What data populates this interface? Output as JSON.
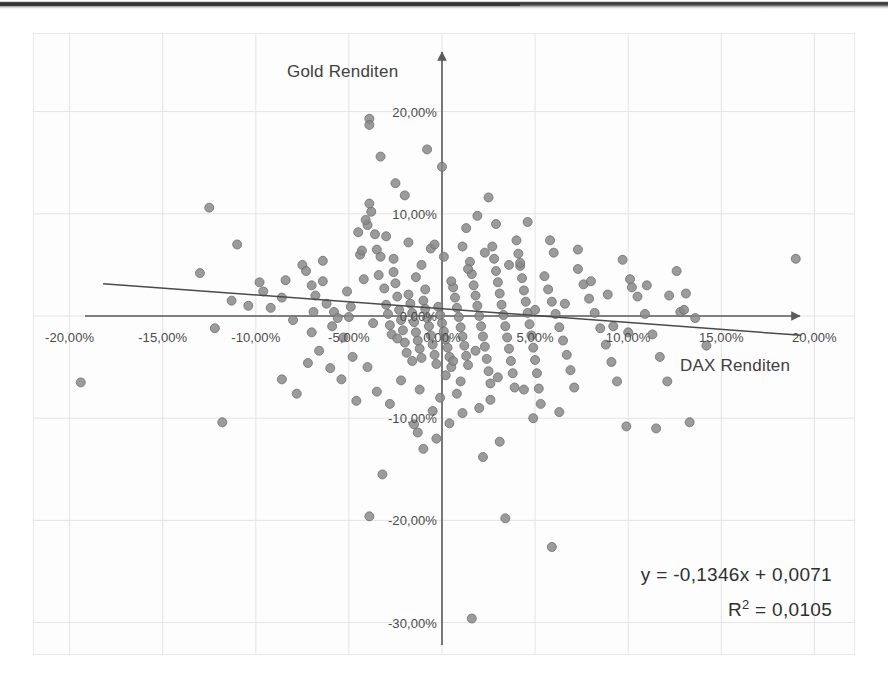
{
  "chart_data": {
    "type": "scatter",
    "title": "",
    "xlabel": "DAX Renditen",
    "ylabel": "Gold Renditen",
    "xlim": [
      -22.0,
      22.0
    ],
    "ylim": [
      -32.0,
      24.0
    ],
    "grid": true,
    "legend": "none",
    "x_ticks": [
      "-20,00%",
      "-15,00%",
      "-10,00%",
      "-5,00%",
      "0,00%",
      "5,00%",
      "10,00%",
      "15,00%",
      "20,00%"
    ],
    "x_tick_values": [
      -20,
      -15,
      -10,
      -5,
      0,
      5,
      10,
      15,
      20
    ],
    "y_ticks": [
      "20,00%",
      "10,00%",
      "0,00%",
      "-10,00%",
      "-20,00%",
      "-30,00%"
    ],
    "y_tick_values": [
      20,
      10,
      0,
      -10,
      -20,
      -30
    ],
    "annotations": {
      "equation": "y = -0,1346x + 0,0071",
      "r_squared_prefix": "R",
      "r_squared_sup": "2",
      "r_squared_value": " = 0,0105"
    },
    "trendline": {
      "slope": -0.1346,
      "intercept": 0.71,
      "x_start": -18.2,
      "x_end": 19.3,
      "color": "#4a4a4a"
    },
    "marker": {
      "color": "#8a8a8a",
      "edge_color": "#6f6f6f",
      "size": 9,
      "shape": "circle"
    },
    "axis_color": "#5a5a5a",
    "grid_color": "#e4e4e4",
    "points": [
      [
        -11.8,
        -10.4
      ],
      [
        -19.4,
        -6.5
      ],
      [
        -12.5,
        10.6
      ],
      [
        -11.0,
        7.0
      ],
      [
        -12.2,
        -1.2
      ],
      [
        -13.0,
        4.2
      ],
      [
        -11.3,
        1.5
      ],
      [
        -9.6,
        2.4
      ],
      [
        -8.6,
        1.8
      ],
      [
        -7.5,
        5.0
      ],
      [
        -7.0,
        3.0
      ],
      [
        -6.4,
        3.4
      ],
      [
        -6.2,
        1.2
      ],
      [
        -5.8,
        0.4
      ],
      [
        -5.6,
        -0.2
      ],
      [
        -5.3,
        -2.1
      ],
      [
        -5.0,
        -0.1
      ],
      [
        -6.0,
        -5.1
      ],
      [
        -5.4,
        -6.2
      ],
      [
        -4.6,
        -8.3
      ],
      [
        -4.4,
        6.0
      ],
      [
        -4.2,
        3.6
      ],
      [
        -4.0,
        8.9
      ],
      [
        -3.8,
        10.2
      ],
      [
        -3.6,
        8.0
      ],
      [
        -3.5,
        6.5
      ],
      [
        -3.3,
        5.8
      ],
      [
        -3.1,
        2.7
      ],
      [
        -3.0,
        1.1
      ],
      [
        -2.9,
        0.2
      ],
      [
        -2.8,
        -0.9
      ],
      [
        -2.7,
        -1.8
      ],
      [
        -2.6,
        4.3
      ],
      [
        -2.5,
        3.2
      ],
      [
        -2.4,
        1.9
      ],
      [
        -2.3,
        0.6
      ],
      [
        -2.2,
        -0.4
      ],
      [
        -2.1,
        -1.4
      ],
      [
        -2.0,
        -2.6
      ],
      [
        -1.9,
        -3.6
      ],
      [
        -1.8,
        2.1
      ],
      [
        -1.7,
        1.2
      ],
      [
        -1.6,
        0.3
      ],
      [
        -1.5,
        -0.6
      ],
      [
        -1.4,
        -1.6
      ],
      [
        -1.3,
        -2.4
      ],
      [
        -1.2,
        -3.2
      ],
      [
        -1.1,
        -4.1
      ],
      [
        -1.0,
        1.5
      ],
      [
        -0.9,
        0.7
      ],
      [
        -0.8,
        -0.2
      ],
      [
        -0.7,
        -1.0
      ],
      [
        -0.6,
        -1.9
      ],
      [
        -0.5,
        -2.8
      ],
      [
        -0.4,
        -3.8
      ],
      [
        -0.3,
        -4.7
      ],
      [
        -0.2,
        0.9
      ],
      [
        -0.1,
        0.1
      ],
      [
        0.0,
        -0.7
      ],
      [
        0.1,
        -1.5
      ],
      [
        0.2,
        -2.3
      ],
      [
        0.3,
        -3.1
      ],
      [
        0.4,
        -4.0
      ],
      [
        0.5,
        -5.0
      ],
      [
        0.6,
        2.8
      ],
      [
        0.7,
        1.8
      ],
      [
        0.8,
        0.8
      ],
      [
        0.9,
        -0.1
      ],
      [
        1.0,
        -1.1
      ],
      [
        1.1,
        -2.0
      ],
      [
        1.2,
        -2.9
      ],
      [
        1.3,
        -3.9
      ],
      [
        1.4,
        -4.8
      ],
      [
        1.5,
        5.3
      ],
      [
        1.6,
        4.1
      ],
      [
        1.7,
        3.0
      ],
      [
        1.8,
        2.0
      ],
      [
        1.9,
        1.0
      ],
      [
        2.0,
        0.0
      ],
      [
        2.1,
        -1.0
      ],
      [
        2.2,
        -2.0
      ],
      [
        2.3,
        -3.0
      ],
      [
        2.4,
        -4.2
      ],
      [
        2.5,
        -5.4
      ],
      [
        2.6,
        -6.6
      ],
      [
        2.7,
        6.8
      ],
      [
        2.8,
        5.6
      ],
      [
        2.9,
        4.4
      ],
      [
        3.0,
        3.3
      ],
      [
        3.1,
        2.2
      ],
      [
        3.2,
        1.1
      ],
      [
        3.3,
        0.1
      ],
      [
        3.4,
        -1.0
      ],
      [
        3.5,
        -2.1
      ],
      [
        3.6,
        -3.2
      ],
      [
        3.7,
        -4.4
      ],
      [
        3.8,
        -5.6
      ],
      [
        3.9,
        -7.0
      ],
      [
        4.0,
        7.4
      ],
      [
        4.1,
        6.1
      ],
      [
        4.2,
        4.9
      ],
      [
        4.3,
        3.7
      ],
      [
        4.4,
        2.5
      ],
      [
        4.5,
        1.4
      ],
      [
        4.6,
        0.3
      ],
      [
        4.7,
        -0.8
      ],
      [
        4.8,
        -1.9
      ],
      [
        4.9,
        -3.1
      ],
      [
        5.0,
        -4.3
      ],
      [
        5.1,
        -5.6
      ],
      [
        5.2,
        -7.1
      ],
      [
        5.3,
        -8.6
      ],
      [
        5.5,
        3.9
      ],
      [
        5.7,
        2.6
      ],
      [
        5.9,
        1.4
      ],
      [
        6.1,
        0.2
      ],
      [
        6.3,
        -1.1
      ],
      [
        6.5,
        -2.4
      ],
      [
        6.7,
        -3.8
      ],
      [
        6.9,
        -5.3
      ],
      [
        7.1,
        -7.0
      ],
      [
        7.3,
        4.6
      ],
      [
        7.6,
        3.1
      ],
      [
        7.9,
        1.7
      ],
      [
        8.2,
        0.3
      ],
      [
        8.5,
        -1.2
      ],
      [
        8.8,
        -2.8
      ],
      [
        9.1,
        -4.5
      ],
      [
        9.4,
        -6.4
      ],
      [
        9.7,
        5.5
      ],
      [
        10.1,
        3.6
      ],
      [
        10.5,
        1.9
      ],
      [
        10.9,
        0.2
      ],
      [
        11.3,
        -1.8
      ],
      [
        11.7,
        -4.0
      ],
      [
        12.1,
        -6.4
      ],
      [
        12.6,
        4.4
      ],
      [
        13.1,
        2.2
      ],
      [
        13.6,
        -0.2
      ],
      [
        14.2,
        -2.9
      ],
      [
        19.0,
        5.6
      ],
      [
        -3.9,
        19.3
      ],
      [
        -3.9,
        18.7
      ],
      [
        -3.3,
        15.6
      ],
      [
        -0.8,
        16.3
      ],
      [
        0.0,
        14.6
      ],
      [
        2.5,
        11.6
      ],
      [
        1.9,
        9.8
      ],
      [
        -3.9,
        11.0
      ],
      [
        -4.1,
        9.4
      ],
      [
        -4.5,
        8.2
      ],
      [
        1.3,
        8.6
      ],
      [
        2.9,
        9.0
      ],
      [
        -1.8,
        7.2
      ],
      [
        -0.6,
        6.6
      ],
      [
        -4.3,
        6.4
      ],
      [
        -3.0,
        7.8
      ],
      [
        5.8,
        7.4
      ],
      [
        6.0,
        6.2
      ],
      [
        7.3,
        6.5
      ],
      [
        4.2,
        5.2
      ],
      [
        -6.4,
        5.4
      ],
      [
        -7.3,
        4.4
      ],
      [
        -8.4,
        3.5
      ],
      [
        -9.8,
        3.3
      ],
      [
        -5.1,
        2.4
      ],
      [
        -6.8,
        2.0
      ],
      [
        2.0,
        -9.0
      ],
      [
        1.1,
        -9.5
      ],
      [
        0.4,
        -10.5
      ],
      [
        -1.5,
        -10.6
      ],
      [
        -1.3,
        -11.4
      ],
      [
        -0.3,
        -12.0
      ],
      [
        -1.0,
        -13.0
      ],
      [
        -3.2,
        -15.5
      ],
      [
        -3.9,
        -19.6
      ],
      [
        3.4,
        -19.8
      ],
      [
        5.9,
        -22.6
      ],
      [
        1.6,
        -29.6
      ],
      [
        13.3,
        -10.4
      ],
      [
        11.5,
        -11.0
      ],
      [
        9.9,
        -10.8
      ],
      [
        -7.8,
        -7.6
      ],
      [
        -8.6,
        -6.2
      ],
      [
        -7.2,
        -4.6
      ],
      [
        -6.6,
        -3.4
      ],
      [
        -2.2,
        -6.3
      ],
      [
        -1.2,
        -7.2
      ],
      [
        0.8,
        -7.6
      ],
      [
        2.6,
        -8.2
      ],
      [
        3.1,
        -12.3
      ],
      [
        2.2,
        -13.8
      ],
      [
        4.9,
        -10.0
      ],
      [
        6.3,
        -9.4
      ],
      [
        -4.8,
        -4.0
      ],
      [
        -4.0,
        -5.0
      ],
      [
        -3.5,
        -7.4
      ],
      [
        -2.8,
        -8.6
      ],
      [
        0.2,
        -5.8
      ],
      [
        1.0,
        -6.4
      ],
      [
        -0.1,
        -8.0
      ],
      [
        -0.5,
        -9.3
      ],
      [
        -9.2,
        0.8
      ],
      [
        -10.4,
        1.0
      ],
      [
        -8.0,
        -0.4
      ],
      [
        -7.0,
        -1.6
      ],
      [
        -2.5,
        13.0
      ],
      [
        -2.0,
        11.8
      ],
      [
        4.6,
        9.2
      ],
      [
        8.0,
        3.4
      ],
      [
        8.9,
        2.1
      ],
      [
        10.2,
        2.8
      ],
      [
        11.0,
        3.0
      ],
      [
        12.2,
        2.0
      ],
      [
        12.8,
        0.4
      ],
      [
        13.0,
        0.6
      ],
      [
        9.2,
        -1.0
      ],
      [
        10.0,
        -1.6
      ],
      [
        -4.9,
        0.9
      ],
      [
        -3.7,
        -0.7
      ],
      [
        -2.4,
        -2.2
      ],
      [
        -1.6,
        -4.4
      ],
      [
        0.6,
        -4.4
      ],
      [
        1.8,
        -3.4
      ],
      [
        3.0,
        -6.0
      ],
      [
        4.4,
        -7.2
      ],
      [
        -5.9,
        -1.0
      ],
      [
        -6.9,
        0.4
      ],
      [
        5.0,
        0.6
      ],
      [
        6.6,
        1.2
      ],
      [
        -0.9,
        2.6
      ],
      [
        -1.4,
        3.8
      ],
      [
        0.5,
        3.4
      ],
      [
        1.4,
        4.6
      ],
      [
        2.3,
        6.2
      ],
      [
        3.6,
        5.0
      ],
      [
        -2.6,
        5.6
      ],
      [
        -3.4,
        4.0
      ],
      [
        -1.1,
        5.0
      ],
      [
        0.1,
        5.8
      ],
      [
        -0.4,
        7.0
      ],
      [
        1.1,
        6.8
      ]
    ]
  }
}
